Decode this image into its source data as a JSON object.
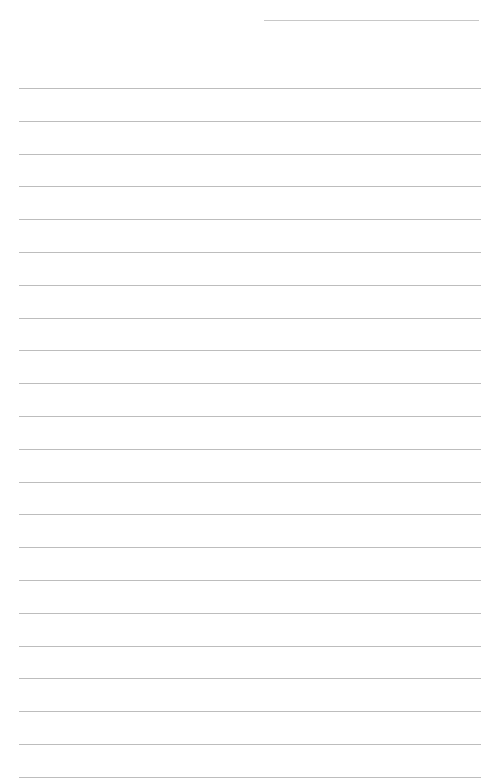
{
  "page": {
    "type": "blank lined paper",
    "background": "#ffffff",
    "line_color": "#bdbdbd",
    "header_line": {
      "x": 264,
      "y": 20,
      "width": 215
    },
    "ruled_lines": {
      "count": 22,
      "start_y": 88,
      "spacing": 32.8,
      "x": 19,
      "width": 462
    }
  }
}
